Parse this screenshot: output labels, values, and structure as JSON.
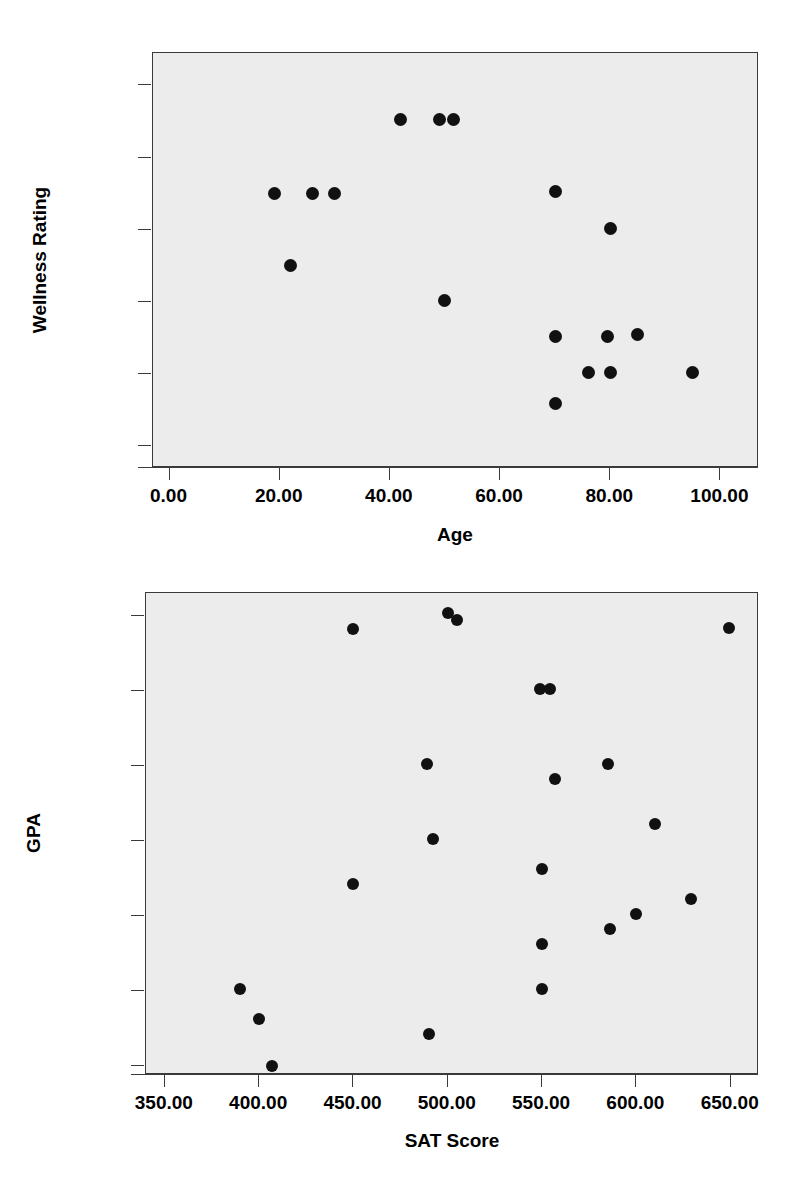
{
  "figure": {
    "background_color": "#ffffff",
    "plot_area_color": "#ececec",
    "axis_color": "#3a3a3a",
    "marker_color": "#111111"
  },
  "chart_data": [
    {
      "type": "scatter",
      "title": "",
      "xlabel": "Age",
      "ylabel": "Wellness Rating",
      "xlim": [
        -3,
        107
      ],
      "ylim": [
        -0.6,
        10.9
      ],
      "xticks": [
        0,
        20,
        40,
        60,
        80,
        100
      ],
      "xticklabels": [
        "0.00",
        "20.00",
        "40.00",
        "60.00",
        "80.00",
        "100.00"
      ],
      "yticks": [
        0,
        2,
        4,
        6,
        8,
        10
      ],
      "yticklabels": [
        "0.00",
        "2.00",
        "4.00",
        "6.00",
        "8.00",
        "10.00"
      ],
      "grid": false,
      "legend": null,
      "points": [
        {
          "x": 19,
          "y": 7.0
        },
        {
          "x": 22,
          "y": 5.0
        },
        {
          "x": 26,
          "y": 7.0
        },
        {
          "x": 30,
          "y": 7.0
        },
        {
          "x": 42,
          "y": 9.05
        },
        {
          "x": 49,
          "y": 9.05
        },
        {
          "x": 51.5,
          "y": 9.05
        },
        {
          "x": 50,
          "y": 4.05
        },
        {
          "x": 70,
          "y": 7.05
        },
        {
          "x": 70,
          "y": 3.05
        },
        {
          "x": 70,
          "y": 1.2
        },
        {
          "x": 76,
          "y": 2.05
        },
        {
          "x": 79.5,
          "y": 3.05
        },
        {
          "x": 80,
          "y": 2.05
        },
        {
          "x": 80,
          "y": 6.05
        },
        {
          "x": 85,
          "y": 3.1
        },
        {
          "x": 95,
          "y": 2.05
        }
      ]
    },
    {
      "type": "scatter",
      "title": "",
      "xlabel": "SAT Score",
      "ylabel": "GPA",
      "xlim": [
        340,
        665
      ],
      "ylim": [
        0.94,
        4.15
      ],
      "xticks": [
        350,
        400,
        450,
        500,
        550,
        600,
        650
      ],
      "xticklabels": [
        "350.00",
        "400.00",
        "450.00",
        "500.00",
        "550.00",
        "600.00",
        "650.00"
      ],
      "yticks": [
        1.0,
        1.5,
        2.0,
        2.5,
        3.0,
        3.5,
        4.0
      ],
      "yticklabels": [
        "1.00",
        "1.50",
        "2.00",
        "2.50",
        "3.00",
        "3.50",
        "4.00"
      ],
      "grid": false,
      "legend": null,
      "points": [
        {
          "x": 390,
          "y": 1.51
        },
        {
          "x": 400,
          "y": 1.31
        },
        {
          "x": 407,
          "y": 1.0
        },
        {
          "x": 450,
          "y": 3.91
        },
        {
          "x": 450,
          "y": 2.21
        },
        {
          "x": 489,
          "y": 3.01
        },
        {
          "x": 490,
          "y": 1.21
        },
        {
          "x": 492,
          "y": 2.51
        },
        {
          "x": 500,
          "y": 4.02
        },
        {
          "x": 505,
          "y": 3.97
        },
        {
          "x": 549,
          "y": 3.51
        },
        {
          "x": 554,
          "y": 3.51
        },
        {
          "x": 550,
          "y": 2.31
        },
        {
          "x": 550,
          "y": 1.81
        },
        {
          "x": 550,
          "y": 1.51
        },
        {
          "x": 557,
          "y": 2.91
        },
        {
          "x": 585,
          "y": 3.01
        },
        {
          "x": 586,
          "y": 1.91
        },
        {
          "x": 600,
          "y": 2.01
        },
        {
          "x": 610,
          "y": 2.61
        },
        {
          "x": 629,
          "y": 2.11
        },
        {
          "x": 649,
          "y": 3.92
        }
      ]
    }
  ]
}
